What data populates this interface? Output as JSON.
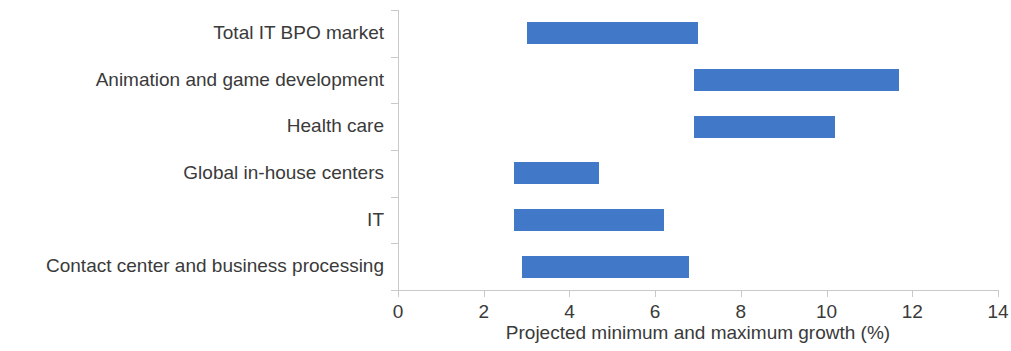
{
  "chart_data": {
    "type": "bar",
    "subtype": "horizontal-range-bar",
    "title": "",
    "subtitle": "",
    "xlabel": "Projected minimum and maximum growth (%)",
    "ylabel": "",
    "xlim": [
      0,
      14
    ],
    "xticks": [
      0,
      2,
      4,
      6,
      8,
      10,
      12,
      14
    ],
    "xtick_labels": [
      "0",
      "2",
      "4",
      "6",
      "8",
      "10",
      "12",
      "14"
    ],
    "grid": false,
    "legend": null,
    "orientation": "horizontal",
    "bar_color": "#4178C8",
    "axis_color": "#c9c9c9",
    "text_color": "#3a3a3a",
    "categories": [
      "Total IT BPO market",
      "Animation and game development",
      "Health care",
      "Global in-house centers",
      "IT",
      "Contact center and business processing"
    ],
    "series": [
      {
        "name": "Projected minimum growth (%)",
        "values": [
          3.0,
          6.9,
          6.9,
          2.7,
          2.7,
          2.9
        ]
      },
      {
        "name": "Projected maximum growth (%)",
        "values": [
          7.0,
          11.7,
          10.2,
          4.7,
          6.2,
          6.8
        ]
      }
    ],
    "bars": [
      {
        "category": "Total IT BPO market",
        "min": 3.0,
        "max": 7.0
      },
      {
        "category": "Animation and game development",
        "min": 6.9,
        "max": 11.7
      },
      {
        "category": "Health care",
        "min": 6.9,
        "max": 10.2
      },
      {
        "category": "Global in-house centers",
        "min": 2.7,
        "max": 4.7
      },
      {
        "category": "IT",
        "min": 2.7,
        "max": 6.2
      },
      {
        "category": "Contact center and business processing",
        "min": 2.9,
        "max": 6.8
      }
    ]
  }
}
